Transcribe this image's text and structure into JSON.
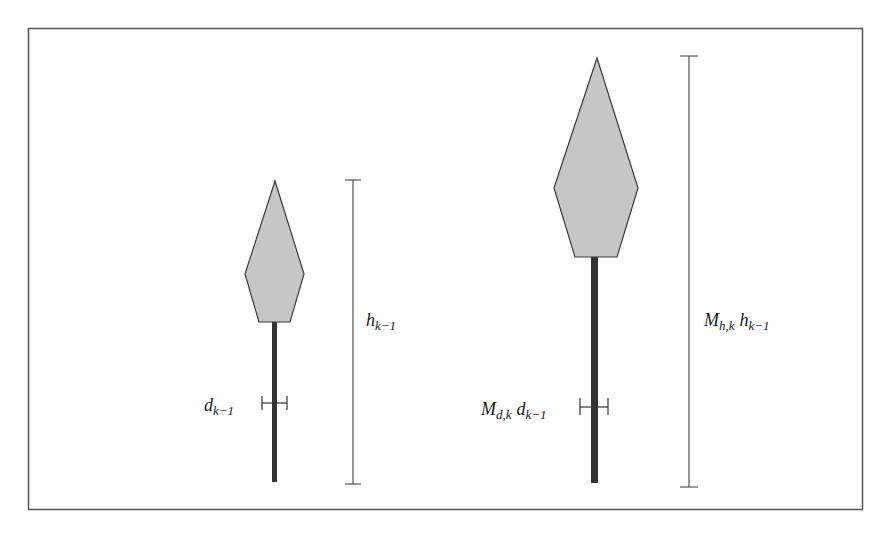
{
  "figure": {
    "colors": {
      "frame": "#555555",
      "crown_fill": "#c6c6c6",
      "crown_stroke": "#3a3a3a",
      "trunk": "#333333",
      "measure_line": "#444444",
      "text": "#1a1a1a"
    }
  },
  "trees": [
    {
      "name": "tree-previous",
      "diameter_label": {
        "main": "d",
        "sub": "k−1",
        "prefix_main": "",
        "prefix_sub": ""
      },
      "height_label": {
        "main": "h",
        "sub": "k−1",
        "prefix_main": "",
        "prefix_sub": ""
      }
    },
    {
      "name": "tree-current",
      "diameter_label": {
        "prefix_main": "M",
        "prefix_sub": "d,k",
        "main": "d",
        "sub": "k−1"
      },
      "height_label": {
        "prefix_main": "M",
        "prefix_sub": "h,k",
        "main": "h",
        "sub": "k−1"
      }
    }
  ]
}
